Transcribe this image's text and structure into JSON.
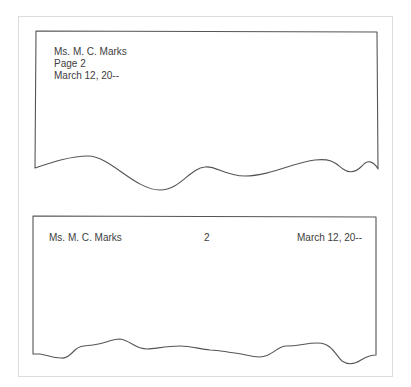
{
  "figure": {
    "examples": [
      {
        "style": "vertical",
        "lines": [
          "Ms. M. C. Marks",
          "Page 2",
          "March 12, 20--"
        ]
      },
      {
        "style": "horizontal",
        "left": "Ms. M. C. Marks",
        "center": "2",
        "right": "March 12, 20--"
      }
    ]
  },
  "colors": {
    "line": "#555555",
    "frame": "#dcdcdc",
    "text": "#3d3d3d"
  }
}
